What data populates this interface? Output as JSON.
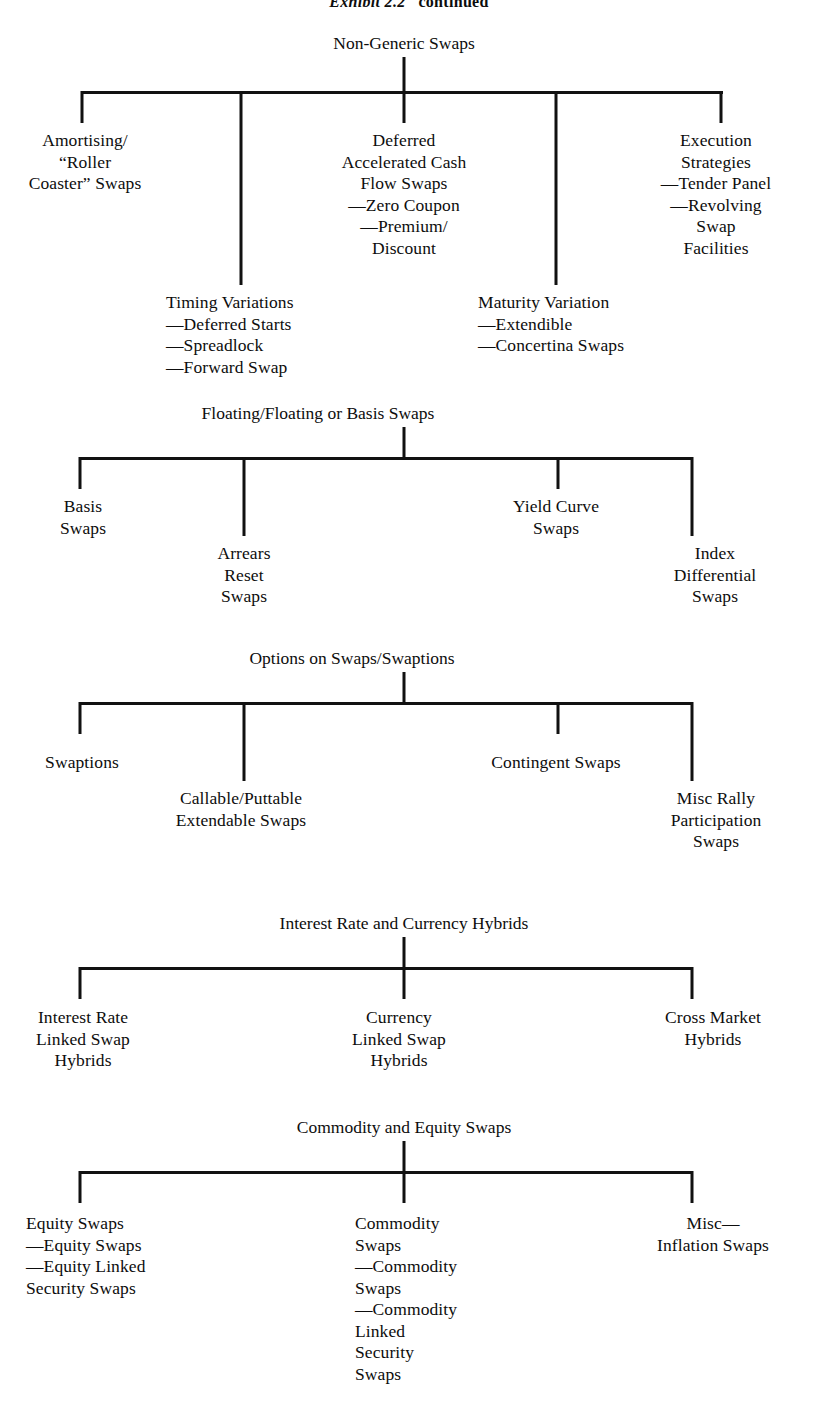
{
  "header": {
    "exhibit_label": "Exhibit 2.2",
    "continued_label": "continued"
  },
  "sections": [
    {
      "id": "non-generic-swaps",
      "title": "Non-Generic Swaps",
      "nodes": {
        "amortising": "Amortising/\n“Roller\nCoaster” Swaps",
        "deferred": "Deferred\nAccelerated Cash\nFlow Swaps\n—Zero Coupon\n—Premium/\nDiscount",
        "execution": "Execution\nStrategies\n—Tender Panel\n—Revolving\nSwap\nFacilities",
        "timing": "Timing Variations\n—Deferred Starts\n—Spreadlock\n—Forward Swap",
        "maturity": "Maturity Variation\n—Extendible\n—Concertina Swaps"
      }
    },
    {
      "id": "floating-floating-basis-swaps",
      "title": "Floating/Floating or Basis Swaps",
      "nodes": {
        "basis": "Basis\nSwaps",
        "arrears": "Arrears\nReset\nSwaps",
        "yield_curve": "Yield Curve\nSwaps",
        "index_differential": "Index\nDifferential\nSwaps"
      }
    },
    {
      "id": "options-on-swaps",
      "title": "Options on Swaps/Swaptions",
      "nodes": {
        "swaptions": "Swaptions",
        "callable": "Callable/Puttable\nExtendable Swaps",
        "contingent": "Contingent Swaps",
        "misc_rally": "Misc Rally\nParticipation\nSwaps"
      }
    },
    {
      "id": "interest-rate-currency-hybrids",
      "title": "Interest Rate and Currency Hybrids",
      "nodes": {
        "interest_rate_linked": "Interest Rate\nLinked Swap\nHybrids",
        "currency_linked": "Currency\nLinked Swap\nHybrids",
        "cross_market": "Cross Market\nHybrids"
      }
    },
    {
      "id": "commodity-equity-swaps",
      "title": "Commodity and Equity Swaps",
      "nodes": {
        "equity": "Equity Swaps\n—Equity Swaps\n—Equity Linked\nSecurity Swaps",
        "commodity": "Commodity\nSwaps\n—Commodity\nSwaps\n—Commodity\nLinked\nSecurity\nSwaps",
        "misc_inflation": "Misc—\nInflation Swaps"
      }
    }
  ]
}
